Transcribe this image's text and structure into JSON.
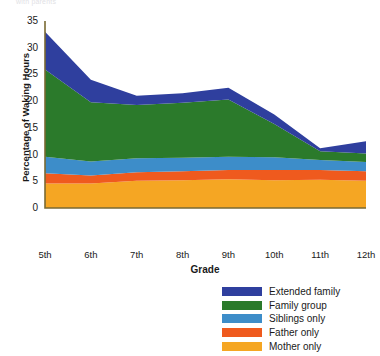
{
  "figure": {
    "faint_header": "with parents",
    "background": "#ffffff"
  },
  "axes": {
    "ylabel": "Percentage of Waking Hours",
    "xlabel": "Grade",
    "yticks": [
      "0",
      "5",
      "10",
      "15",
      "20",
      "25",
      "30",
      "35"
    ],
    "xticks": [
      "5th",
      "6th",
      "7th",
      "8th",
      "9th",
      "10th",
      "11th",
      "12th"
    ],
    "axis_color": "#7a6a33"
  },
  "legend": {
    "items": [
      {
        "label": "Extended family",
        "color": "#2f3f9e"
      },
      {
        "label": "Family group",
        "color": "#2b7a2b"
      },
      {
        "label": "Siblings only",
        "color": "#3d8dc9"
      },
      {
        "label": "Father only",
        "color": "#ef5a1e"
      },
      {
        "label": "Mother only",
        "color": "#f5a623"
      }
    ]
  },
  "chart_data": {
    "type": "area",
    "stacked": true,
    "title": "",
    "xlabel": "Grade",
    "ylabel": "Percentage of Waking Hours",
    "categories": [
      "5th",
      "6th",
      "7th",
      "8th",
      "9th",
      "10th",
      "11th",
      "12th"
    ],
    "x": [
      5,
      6,
      7,
      8,
      9,
      10,
      11,
      12
    ],
    "ylim": [
      0,
      35
    ],
    "xlim": [
      5,
      12
    ],
    "grid": false,
    "legend_position": "bottom-right",
    "series": [
      {
        "name": "Mother only",
        "color": "#f5a623",
        "values": [
          4.6,
          4.6,
          5.1,
          5.2,
          5.4,
          5.2,
          5.3,
          5.1
        ]
      },
      {
        "name": "Father only",
        "color": "#ef5a1e",
        "values": [
          1.9,
          1.5,
          1.6,
          1.7,
          1.7,
          1.9,
          1.8,
          1.8
        ]
      },
      {
        "name": "Siblings only",
        "color": "#3d8dc9",
        "values": [
          3.1,
          2.6,
          2.6,
          2.5,
          2.5,
          2.4,
          1.9,
          1.7
        ]
      },
      {
        "name": "Family group",
        "color": "#2b7a2b",
        "values": [
          16.3,
          11.1,
          10.0,
          10.3,
          10.7,
          6.2,
          1.6,
          1.6
        ]
      },
      {
        "name": "Extended family",
        "color": "#2f3f9e",
        "values": [
          7.1,
          4.2,
          1.7,
          1.8,
          2.2,
          1.8,
          0.6,
          2.3
        ]
      }
    ],
    "totals": [
      33.0,
      24.0,
      21.0,
      21.5,
      22.5,
      17.5,
      11.2,
      12.5
    ]
  }
}
